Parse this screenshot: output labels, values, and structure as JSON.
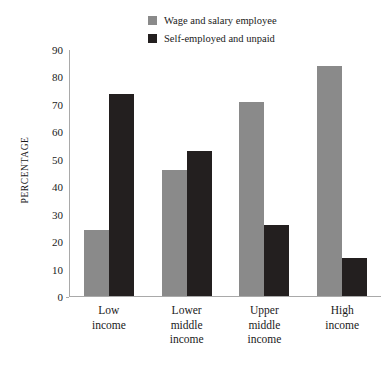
{
  "chart_data": {
    "type": "bar",
    "title": "",
    "xlabel": "",
    "ylabel": "PERCENTAGE",
    "ylim": [
      0,
      90
    ],
    "ytick_step": 10,
    "yticks": [
      0,
      10,
      20,
      30,
      40,
      50,
      60,
      70,
      80,
      90
    ],
    "grid": false,
    "legend_position": "top-center",
    "categories": [
      "Low\nincome",
      "Lower\nmiddle\nincome",
      "Upper\nmiddle\nincome",
      "High\nincome"
    ],
    "series": [
      {
        "name": "Wage and salary employee",
        "color": "#8a8a8a",
        "values": [
          24,
          46,
          71,
          84
        ]
      },
      {
        "name": "Self-employed and unpaid",
        "color": "#231f1f",
        "values": [
          74,
          53,
          26,
          14
        ]
      }
    ]
  },
  "legend": {
    "items": [
      {
        "label": "Wage and salary employee",
        "color": "#8a8a8a"
      },
      {
        "label": "Self-employed and unpaid",
        "color": "#231f1f"
      }
    ]
  },
  "axis": {
    "y_title": "PERCENTAGE",
    "y_ticks": [
      "90",
      "80",
      "70",
      "60",
      "50",
      "40",
      "30",
      "20",
      "10",
      "0"
    ]
  },
  "xaxis": {
    "labels": [
      {
        "line1": "Low",
        "line2": "income",
        "line3": ""
      },
      {
        "line1": "Lower",
        "line2": "middle",
        "line3": "income"
      },
      {
        "line1": "Upper",
        "line2": "middle",
        "line3": "income"
      },
      {
        "line1": "High",
        "line2": "income",
        "line3": ""
      }
    ]
  },
  "colors": {
    "series_wage": "#8a8a8a",
    "series_self": "#231f1f",
    "axis": "#a9a9a9",
    "text": "#1a1a1a",
    "background": "#ffffff"
  }
}
